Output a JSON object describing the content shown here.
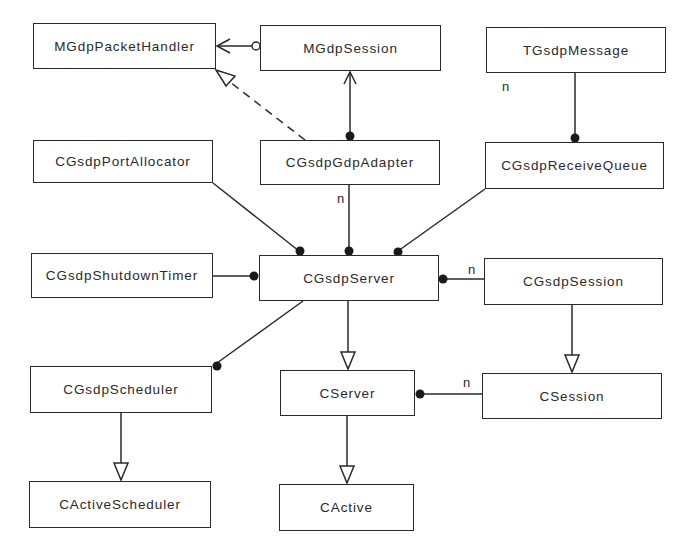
{
  "diagram": {
    "type": "uml-class-diagram",
    "classes": [
      {
        "id": "MGdpPacketHandler",
        "label": "MGdpPacketHandler",
        "box": [
          33,
          23,
          183,
          46
        ]
      },
      {
        "id": "MGdpSession",
        "label": "MGdpSession",
        "box": [
          260,
          25,
          181,
          46
        ]
      },
      {
        "id": "TGsdpMessage",
        "label": "TGsdpMessage",
        "box": [
          486,
          27,
          180,
          46
        ]
      },
      {
        "id": "CGsdpPortAllocator",
        "label": "CGsdpPortAllocator",
        "box": [
          33,
          140,
          180,
          43
        ]
      },
      {
        "id": "CGsdpGdpAdapter",
        "label": "CGsdpGdpAdapter",
        "box": [
          260,
          140,
          180,
          45
        ]
      },
      {
        "id": "CGsdpReceiveQueue",
        "label": "CGsdpReceiveQueue",
        "box": [
          485,
          142,
          179,
          47
        ]
      },
      {
        "id": "CGsdpShutdownTimer",
        "label": "CGsdpShutdownTimer",
        "box": [
          31,
          253,
          182,
          45
        ]
      },
      {
        "id": "CGsdpServer",
        "label": "CGsdpServer",
        "box": [
          259,
          255,
          180,
          46
        ]
      },
      {
        "id": "CGsdpSession",
        "label": "CGsdpSession",
        "box": [
          484,
          258,
          179,
          47
        ]
      },
      {
        "id": "CGsdpScheduler",
        "label": "CGsdpScheduler",
        "box": [
          30,
          366,
          182,
          47
        ]
      },
      {
        "id": "CServer",
        "label": "CServer",
        "box": [
          280,
          370,
          135,
          46
        ]
      },
      {
        "id": "CSession",
        "label": "CSession",
        "box": [
          482,
          373,
          180,
          46
        ]
      },
      {
        "id": "CActiveScheduler",
        "label": "CActiveScheduler",
        "box": [
          29,
          481,
          182,
          47
        ]
      },
      {
        "id": "CActive",
        "label": "CActive",
        "box": [
          279,
          484,
          135,
          47
        ]
      }
    ],
    "relationships": [
      {
        "from": "MGdpSession",
        "to": "MGdpPacketHandler",
        "kind": "uses-interface",
        "source_end": "open-circle",
        "target_end": "open-arrow"
      },
      {
        "from": "CGsdpGdpAdapter",
        "to": "MGdpPacketHandler",
        "kind": "realization",
        "line": "dashed",
        "target_end": "hollow-triangle"
      },
      {
        "from": "CGsdpGdpAdapter",
        "to": "MGdpSession",
        "kind": "association",
        "source_end": "filled-dot",
        "target_end": "open-arrow"
      },
      {
        "from": "CGsdpReceiveQueue",
        "to": "TGsdpMessage",
        "kind": "aggregation",
        "source_end": "filled-dot",
        "multiplicity": "n"
      },
      {
        "from": "CGsdpServer",
        "to": "CGsdpPortAllocator",
        "kind": "ownership",
        "source_end": "filled-dot"
      },
      {
        "from": "CGsdpServer",
        "to": "CGsdpGdpAdapter",
        "kind": "ownership",
        "source_end": "filled-dot",
        "multiplicity": "n"
      },
      {
        "from": "CGsdpServer",
        "to": "CGsdpReceiveQueue",
        "kind": "ownership",
        "source_end": "filled-dot"
      },
      {
        "from": "CGsdpServer",
        "to": "CGsdpShutdownTimer",
        "kind": "ownership",
        "source_end": "filled-dot"
      },
      {
        "from": "CGsdpServer",
        "to": "CGsdpSession",
        "kind": "ownership",
        "source_end": "filled-dot",
        "multiplicity": "n"
      },
      {
        "from": "CGsdpServer",
        "to": "CGsdpScheduler",
        "kind": "ownership",
        "target_end": "filled-dot"
      },
      {
        "from": "CGsdpServer",
        "to": "CServer",
        "kind": "inheritance",
        "target_end": "hollow-triangle"
      },
      {
        "from": "CGsdpSession",
        "to": "CSession",
        "kind": "inheritance",
        "target_end": "hollow-triangle"
      },
      {
        "from": "CServer",
        "to": "CSession",
        "kind": "ownership",
        "source_end": "filled-dot",
        "multiplicity": "n"
      },
      {
        "from": "CGsdpScheduler",
        "to": "CActiveScheduler",
        "kind": "inheritance",
        "target_end": "hollow-triangle"
      },
      {
        "from": "CServer",
        "to": "CActive",
        "kind": "inheritance",
        "target_end": "hollow-triangle"
      }
    ],
    "multiplicity_labels": [
      {
        "text": "n",
        "x": 502,
        "y": 79
      },
      {
        "text": "n",
        "x": 337,
        "y": 191
      },
      {
        "text": "n",
        "x": 468,
        "y": 264
      },
      {
        "text": "n",
        "x": 463,
        "y": 375
      }
    ],
    "colors": {
      "line": "#2a2a2a",
      "background": "#ffffff",
      "box_fill": "#ffffff"
    }
  }
}
